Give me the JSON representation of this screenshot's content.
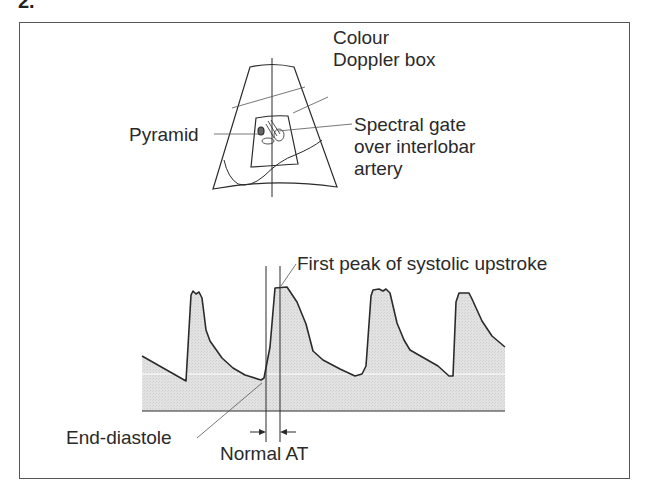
{
  "figure": {
    "number": "2.",
    "top_panel": {
      "description": "Sector ultrasound image schematic of kidney",
      "labels": {
        "colour_doppler_line1": "Colour",
        "colour_doppler_line2": "Doppler box",
        "pyramid": "Pyramid",
        "spectral_gate_line1": "Spectral gate",
        "spectral_gate_line2": "over interlobar",
        "spectral_gate_line3": "artery"
      }
    },
    "bottom_panel": {
      "description": "Doppler spectral waveform of interlobar artery",
      "labels": {
        "first_peak": "First peak of systolic upstroke",
        "end_diastole": "End-diastole",
        "normal_at": "Normal AT"
      }
    },
    "colors": {
      "line": "#2b2b2b",
      "fill": "#dcdcdc",
      "frame": "#555555",
      "text": "#2a2a2a"
    }
  }
}
